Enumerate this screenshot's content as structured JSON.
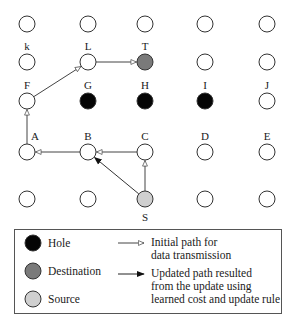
{
  "colors": {
    "node_empty": "#ffffff",
    "hole": "#050505",
    "destination": "#7a7a7a",
    "source": "#cfcfcf",
    "stroke": "#333333",
    "edge": "#444444"
  },
  "grid": {
    "columns_x": [
      27,
      88,
      145,
      205,
      267
    ],
    "rows_y": [
      24,
      62,
      101,
      152,
      199
    ],
    "node_radius": 8
  },
  "nodes": [
    {
      "id": "r1c1",
      "col": 0,
      "row": 0,
      "type": "empty",
      "label": ""
    },
    {
      "id": "r1c2",
      "col": 1,
      "row": 0,
      "type": "empty",
      "label": ""
    },
    {
      "id": "r1c3",
      "col": 2,
      "row": 0,
      "type": "empty",
      "label": ""
    },
    {
      "id": "r1c4",
      "col": 3,
      "row": 0,
      "type": "empty",
      "label": ""
    },
    {
      "id": "r1c5",
      "col": 4,
      "row": 0,
      "type": "empty",
      "label": ""
    },
    {
      "id": "k",
      "col": 0,
      "row": 1,
      "type": "empty",
      "label": "k"
    },
    {
      "id": "L",
      "col": 1,
      "row": 1,
      "type": "empty",
      "label": "L"
    },
    {
      "id": "T",
      "col": 2,
      "row": 1,
      "type": "destination",
      "label": "T"
    },
    {
      "id": "r2c4",
      "col": 3,
      "row": 1,
      "type": "empty",
      "label": ""
    },
    {
      "id": "r2c5",
      "col": 4,
      "row": 1,
      "type": "empty",
      "label": ""
    },
    {
      "id": "F",
      "col": 0,
      "row": 2,
      "type": "empty",
      "label": "F"
    },
    {
      "id": "G",
      "col": 1,
      "row": 2,
      "type": "hole",
      "label": "G"
    },
    {
      "id": "H",
      "col": 2,
      "row": 2,
      "type": "hole",
      "label": "H"
    },
    {
      "id": "I",
      "col": 3,
      "row": 2,
      "type": "hole",
      "label": "I"
    },
    {
      "id": "J",
      "col": 4,
      "row": 2,
      "type": "empty",
      "label": "J"
    },
    {
      "id": "A",
      "col": 0,
      "row": 3,
      "type": "empty",
      "label": "A"
    },
    {
      "id": "B",
      "col": 1,
      "row": 3,
      "type": "empty",
      "label": "B"
    },
    {
      "id": "C",
      "col": 2,
      "row": 3,
      "type": "empty",
      "label": "C"
    },
    {
      "id": "D",
      "col": 3,
      "row": 3,
      "type": "empty",
      "label": "D"
    },
    {
      "id": "E",
      "col": 4,
      "row": 3,
      "type": "empty",
      "label": "E"
    },
    {
      "id": "r5c1",
      "col": 0,
      "row": 4,
      "type": "empty",
      "label": ""
    },
    {
      "id": "r5c2",
      "col": 1,
      "row": 4,
      "type": "empty",
      "label": ""
    },
    {
      "id": "S",
      "col": 2,
      "row": 4,
      "type": "source",
      "label": "S"
    },
    {
      "id": "r5c4",
      "col": 3,
      "row": 4,
      "type": "empty",
      "label": ""
    },
    {
      "id": "r5c5",
      "col": 4,
      "row": 4,
      "type": "empty",
      "label": ""
    }
  ],
  "edges": [
    {
      "from": "S",
      "to": "C",
      "kind": "initial"
    },
    {
      "from": "C",
      "to": "B",
      "kind": "initial"
    },
    {
      "from": "B",
      "to": "A",
      "kind": "initial"
    },
    {
      "from": "A",
      "to": "F",
      "kind": "initial"
    },
    {
      "from": "F",
      "to": "L",
      "kind": "initial"
    },
    {
      "from": "L",
      "to": "T",
      "kind": "initial"
    },
    {
      "from": "S",
      "to": "B",
      "kind": "updated"
    }
  ],
  "legend": {
    "hole": "Hole",
    "destination": "Destination",
    "source": "Source",
    "initial_path_line1": "Initial path for",
    "initial_path_line2": "data transmission",
    "updated_path_line1": "Updated path resulted",
    "updated_path_line2": "from the update using",
    "updated_path_line3": "learned cost and update rule"
  }
}
